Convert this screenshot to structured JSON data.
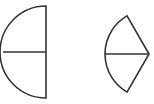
{
  "diagram": {
    "background": "#ffffff",
    "stroke_color": "#333333",
    "shapes": [
      {
        "name": "semicircle-with-radius",
        "type": "half-disk",
        "center": [
          46,
          52
        ],
        "radius": 46,
        "divider": "horizontal radius from arc to diameter"
      },
      {
        "name": "sector-with-bisector",
        "type": "circular-sector",
        "center": [
          149,
          54
        ],
        "radius": 44,
        "angle_deg": 120,
        "divider": "horizontal bisecting radius"
      }
    ]
  }
}
